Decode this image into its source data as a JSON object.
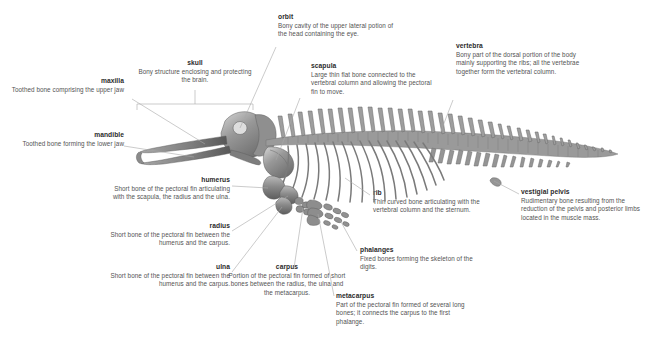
{
  "figure": {
    "background_color": "#ffffff",
    "text_color": "#4a4a4a",
    "term_color": "#2b2b2b",
    "leader_line_color": "#a8a8a8",
    "bone_color": "#8d8d8d"
  },
  "labels": {
    "orbit": {
      "term": "orbit",
      "desc": "Bony cavity of the upper lateral potion of the head containing the eye."
    },
    "skull": {
      "term": "skull",
      "desc": "Bony structure enclosing and protecting the brain."
    },
    "scapula": {
      "term": "scapula",
      "desc": "Large thin flat bone connected to the vertebral column and allowing the pectoral fin to move."
    },
    "vertebra": {
      "term": "vertebra",
      "desc": "Bony part of the dorsal portion of the body mainly supporting the ribs; all the vertebrae together form the vertebral column."
    },
    "maxilla": {
      "term": "maxilla",
      "desc": "Toothed bone comprising the upper jaw"
    },
    "mandible": {
      "term": "mandible",
      "desc": "Toothed bone forming the lower jaw"
    },
    "humerus": {
      "term": "humerus",
      "desc": "Short bone of the pectoral fin articulating with the scapula, the radius and the ulna."
    },
    "radius": {
      "term": "radius",
      "desc": "Short bone of the pectoral fin between the humerus and the carpus."
    },
    "ulna": {
      "term": "ulna",
      "desc": "Short bone of the pectoral fin between the humerus and the carpus."
    },
    "carpus": {
      "term": "carpus",
      "desc": "Portion of the pectoral fin formed of short bones between the radius, the ulna and the metacarpus."
    },
    "metacarpus": {
      "term": "metacarpus",
      "desc": "Part of the pectoral fin formed of several long bones; it connects the carpus to the first phalange."
    },
    "phalanges": {
      "term": "phalanges",
      "desc": "Fixed bones forming the skeleton of the digits."
    },
    "rib": {
      "term": "rib",
      "desc": "Thin curved bone articulating with the vertebral column and the sternum."
    },
    "vestigial_pelvis": {
      "term": "vestigial pelvis",
      "desc": "Rudimentary bone resulting from the reduction of the pelvis and posterior limbs located in the muscle mass."
    }
  }
}
